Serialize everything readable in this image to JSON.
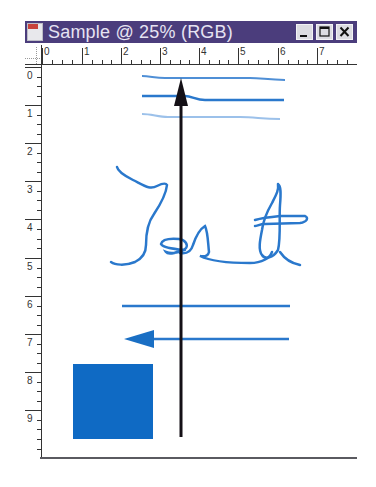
{
  "window": {
    "title": "Sample @ 25% (RGB)",
    "controls": {
      "minimize": "minimize",
      "maximize": "maximize",
      "close": "close"
    },
    "colors": {
      "titlebar": "#4b3d7c",
      "title_text": "#e6e3f2"
    }
  },
  "rulers": {
    "horizontal": {
      "labels": [
        "0",
        "1",
        "2",
        "3",
        "4",
        "5",
        "6",
        "7"
      ]
    },
    "vertical": {
      "labels": [
        "0",
        "1",
        "2",
        "3",
        "4",
        "5",
        "6",
        "7",
        "8",
        "9"
      ]
    }
  },
  "canvas": {
    "zoom": "25%",
    "color_mode": "RGB",
    "drawing_color": "#1a6fc4",
    "shapes": [
      "three-wavy-horizontal-lines",
      "handwritten-text-Test",
      "horizontal-line",
      "left-arrow",
      "filled-square",
      "vertical-up-arrow-black"
    ],
    "handwriting": "Test"
  }
}
